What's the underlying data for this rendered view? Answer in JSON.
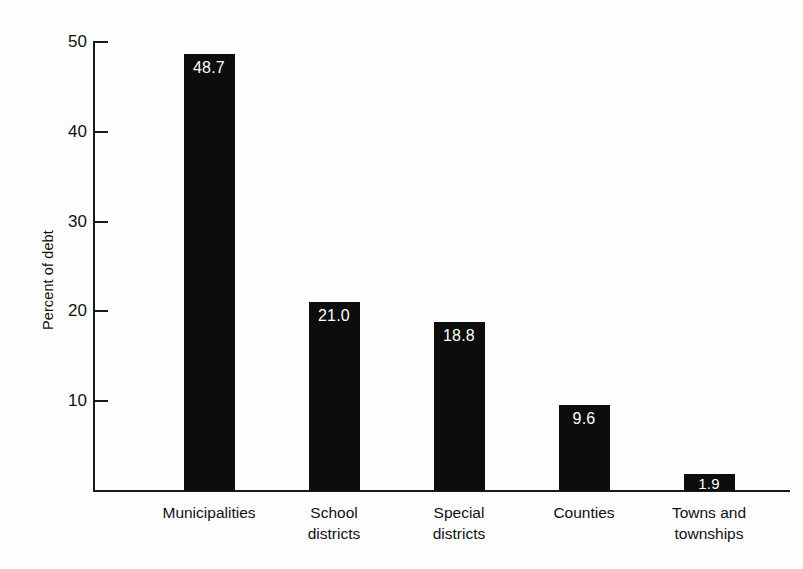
{
  "chart_data": {
    "type": "bar",
    "title": "",
    "xlabel": "",
    "ylabel": "Percent of debt",
    "ylim": [
      0,
      50
    ],
    "yticks": [
      50,
      40,
      30,
      20,
      10
    ],
    "grid": false,
    "legend": false,
    "categories": [
      "Municipalities",
      "School districts",
      "Special districts",
      "Counties",
      "Towns and townships"
    ],
    "category_lines": [
      [
        "Municipalities"
      ],
      [
        "School",
        "districts"
      ],
      [
        "Special",
        "districts"
      ],
      [
        "Counties"
      ],
      [
        "Towns and",
        "townships"
      ]
    ],
    "values": [
      48.7,
      21.0,
      18.8,
      9.6,
      1.9
    ],
    "value_labels": [
      "48.7",
      "21.0",
      "18.8",
      "9.6",
      "1.9"
    ],
    "bar_color": "#0d0d0d",
    "value_label_color": "#ffffff",
    "axis_color": "#1a1a1a",
    "background_color": "#fdfdfd"
  }
}
